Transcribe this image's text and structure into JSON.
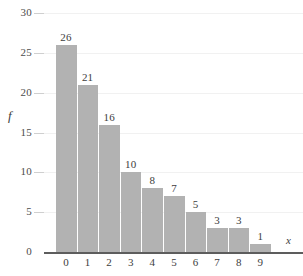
{
  "chart_data": {
    "type": "bar",
    "title": "",
    "subtitle": "",
    "xlabel": "x",
    "ylabel": "f",
    "categories": [
      "0",
      "1",
      "2",
      "3",
      "4",
      "5",
      "6",
      "7",
      "8",
      "9"
    ],
    "values": [
      26,
      21,
      16,
      10,
      8,
      7,
      5,
      3,
      3,
      1
    ],
    "value_labels": [
      "26",
      "21",
      "16",
      "10",
      "8",
      "7",
      "5",
      "3",
      "3",
      "1"
    ],
    "ylim": [
      0,
      30
    ],
    "xlim": [
      -0.5,
      9.5
    ],
    "y_ticks": [
      0,
      5,
      10,
      15,
      20,
      25,
      30
    ],
    "y_tick_labels": [
      "0",
      "5",
      "10",
      "15",
      "20",
      "25",
      "30"
    ],
    "grid": true,
    "grid_axis": "y",
    "legend": false,
    "legend_position": "none",
    "bar_color": "#b2b2b2",
    "grid_color": "#f1f1f1",
    "axis_color": "#5d5d5d",
    "text_color": "#3d3d3d",
    "background": "#ffffff",
    "annotations": []
  }
}
